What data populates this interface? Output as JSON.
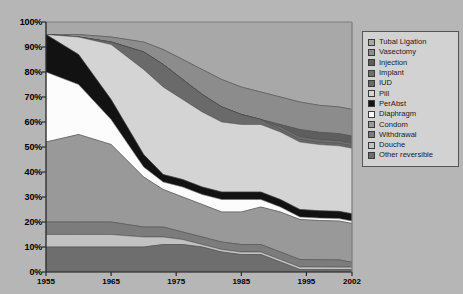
{
  "chart_data": {
    "type": "area",
    "title": "",
    "xlabel": "",
    "ylabel": "",
    "stacked": true,
    "normalized_percent": true,
    "grid": false,
    "legend_position": "right",
    "xlim": [
      1955,
      2002
    ],
    "ylim": [
      0,
      100
    ],
    "x_tick_labels": [
      "1955",
      "1965",
      "1975",
      "1985",
      "1995",
      "2002"
    ],
    "x_ticks": [
      1955,
      1965,
      1975,
      1985,
      1995,
      2002
    ],
    "y_tick_labels": [
      "0%",
      "10%",
      "20%",
      "30%",
      "40%",
      "50%",
      "60%",
      "70%",
      "80%",
      "90%",
      "100%"
    ],
    "y_ticks": [
      0,
      10,
      20,
      30,
      40,
      50,
      60,
      70,
      80,
      90,
      100
    ],
    "x": [
      1955,
      1960,
      1965,
      1970,
      1973,
      1976,
      1979,
      1982,
      1985,
      1988,
      1991,
      1994,
      1997,
      2000,
      2002
    ],
    "series": [
      {
        "name": "Tubal Ligation",
        "color": "#a8a8a8",
        "values": [
          5,
          5,
          6,
          8,
          11,
          15,
          19,
          23,
          26,
          28,
          30,
          32,
          34,
          35,
          36
        ]
      },
      {
        "name": "Vasectomy",
        "color": "#8c8c8c",
        "values": [
          0,
          1,
          2,
          4,
          6,
          8,
          10,
          11,
          11,
          11,
          11,
          11,
          11,
          11,
          11
        ]
      },
      {
        "name": "Injection",
        "color": "#5e5e5e",
        "values": [
          0,
          0,
          0,
          0,
          0,
          0,
          0,
          0,
          0,
          0,
          1,
          3,
          3,
          3,
          3
        ]
      },
      {
        "name": "Implant",
        "color": "#707070",
        "values": [
          0,
          0,
          0,
          0,
          0,
          0,
          0,
          0,
          0,
          0,
          1,
          1,
          1,
          1,
          1
        ]
      },
      {
        "name": "IUD",
        "color": "#6a6a6a",
        "values": [
          0,
          0,
          1,
          7,
          9,
          8,
          7,
          6,
          4,
          2,
          1,
          1,
          1,
          1,
          1
        ]
      },
      {
        "name": "Pill",
        "color": "#d4d4d4",
        "values": [
          0,
          7,
          22,
          34,
          35,
          32,
          30,
          28,
          27,
          27,
          27,
          27,
          27,
          27,
          27
        ]
      },
      {
        "name": "PerAbst",
        "color": "#121212",
        "values": [
          15,
          12,
          8,
          5,
          3,
          3,
          3,
          3,
          3,
          3,
          3,
          3,
          3,
          3,
          3
        ]
      },
      {
        "name": "Diaphragm",
        "color": "#fcfcfc",
        "values": [
          28,
          20,
          10,
          4,
          3,
          4,
          4,
          5,
          5,
          3,
          2,
          1,
          1,
          1,
          1
        ]
      },
      {
        "name": "Condom",
        "color": "#999999",
        "values": [
          32,
          35,
          31,
          20,
          15,
          14,
          13,
          12,
          13,
          15,
          16,
          16,
          16,
          16,
          16
        ]
      },
      {
        "name": "Withdrawal",
        "color": "#7c7c7c",
        "values": [
          5,
          5,
          5,
          4,
          4,
          3,
          3,
          3,
          3,
          3,
          3,
          3,
          3,
          3,
          2
        ]
      },
      {
        "name": "Douche",
        "color": "#c2c2c2",
        "values": [
          5,
          5,
          5,
          4,
          3,
          2,
          1,
          1,
          1,
          1,
          1,
          1,
          1,
          1,
          1
        ]
      },
      {
        "name": "Other reversible",
        "color": "#6e6e6e",
        "values": [
          10,
          10,
          10,
          10,
          11,
          11,
          10,
          8,
          7,
          7,
          4,
          1,
          1,
          1,
          1
        ]
      }
    ]
  },
  "legend": {
    "items": [
      {
        "label": "Tubal Ligation",
        "color": "#a8a8a8"
      },
      {
        "label": "Vasectomy",
        "color": "#8c8c8c"
      },
      {
        "label": "Injection",
        "color": "#5e5e5e"
      },
      {
        "label": "Implant",
        "color": "#707070"
      },
      {
        "label": "IUD",
        "color": "#6a6a6a"
      },
      {
        "label": "Pill",
        "color": "#d4d4d4"
      },
      {
        "label": "PerAbst",
        "color": "#121212"
      },
      {
        "label": "Diaphragm",
        "color": "#fcfcfc"
      },
      {
        "label": "Condom",
        "color": "#999999"
      },
      {
        "label": "Withdrawal",
        "color": "#7c7c7c"
      },
      {
        "label": "Douche",
        "color": "#c2c2c2"
      },
      {
        "label": "Other reversible",
        "color": "#6e6e6e"
      }
    ]
  },
  "plot": {
    "background": "#b6b6b6",
    "axis_color": "#2b2b2b",
    "left": 46,
    "top": 22,
    "right": 352,
    "bottom": 272
  }
}
